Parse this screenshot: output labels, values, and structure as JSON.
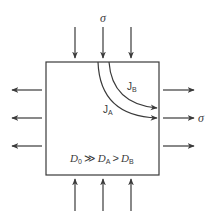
{
  "diagram": {
    "stress_symbol": "σ",
    "flux_labels": {
      "a": {
        "main": "J",
        "sub": "A"
      },
      "b": {
        "main": "J",
        "sub": "B"
      }
    },
    "diffusivity_relation": {
      "d0": {
        "main": "D",
        "sub": "0"
      },
      "op1": "≫",
      "da": {
        "main": "D",
        "sub": "A"
      },
      "op2": ">",
      "db": {
        "main": "D",
        "sub": "B"
      }
    },
    "colors": {
      "line": "#3a3a3a",
      "background": "#ffffff"
    }
  }
}
